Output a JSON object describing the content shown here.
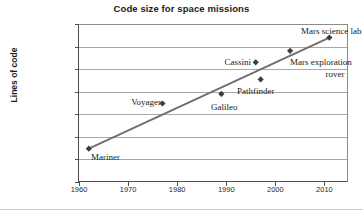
{
  "chart_data": {
    "type": "scatter",
    "title": "Code size for space missions",
    "xlabel": "",
    "ylabel": "Lines of code",
    "yscale": "log",
    "ylim": [
      1,
      10000000
    ],
    "xlim": [
      1960,
      2015
    ],
    "grid": true,
    "legend": false,
    "ytick_labels": [
      "10,000,000",
      "1,000,000",
      "100,000",
      "10,000",
      "1000",
      "100",
      "10",
      "1"
    ],
    "ytick_values": [
      10000000,
      1000000,
      100000,
      10000,
      1000,
      100,
      10,
      1
    ],
    "xtick_labels": [
      "1960",
      "1970",
      "1980",
      "1990",
      "2000",
      "2010"
    ],
    "xtick_values": [
      1960,
      1970,
      1980,
      1990,
      2000,
      2010
    ],
    "points": [
      {
        "name": "Mariner",
        "x": 1962,
        "y": 30,
        "label": "Mariner"
      },
      {
        "name": "Voyager",
        "x": 1977,
        "y": 3000,
        "label": "Voyager"
      },
      {
        "name": "Galileo",
        "x": 1989,
        "y": 8000,
        "label": "Galileo"
      },
      {
        "name": "Cassini",
        "x": 1996,
        "y": 200000,
        "label": "Cassini"
      },
      {
        "name": "Pathfinder",
        "x": 1997,
        "y": 35000,
        "label": "Pathfinder"
      },
      {
        "name": "Mars exploration rover",
        "x": 2003,
        "y": 650000,
        "label": "Mars exploration"
      },
      {
        "name": "Mars science lab",
        "x": 2011,
        "y": 2500000,
        "label": "Mars science lab"
      }
    ],
    "trendline": {
      "x_start": 1962,
      "y_start": 30,
      "x_end": 2011,
      "y_end": 2500000
    },
    "marker": "diamond",
    "marker_color": "#3d3d3d",
    "line_color": "#6e6e6e"
  },
  "labels": {
    "mariner": "Mariner",
    "voyager": "Voyager",
    "galileo": "Galileo",
    "cassini": "Cassini",
    "pathfinder": "Pathfinder",
    "mer_line1": "Mars exploration",
    "mer_line2": "rover",
    "msl": "Mars science lab"
  },
  "ticks": {
    "y": [
      "10,000,000",
      "1,000,000",
      "100,000",
      "10,000",
      "1000",
      "100",
      "10",
      "1"
    ],
    "x": [
      "1960",
      "1970",
      "1980",
      "1990",
      "2000",
      "2010"
    ]
  },
  "colors": {
    "marker": "#3d3d3d",
    "line": "#6e6e6e",
    "grid": "#a8a8a8",
    "axis": "#4d4d4d",
    "text": "#1a1a1a"
  }
}
